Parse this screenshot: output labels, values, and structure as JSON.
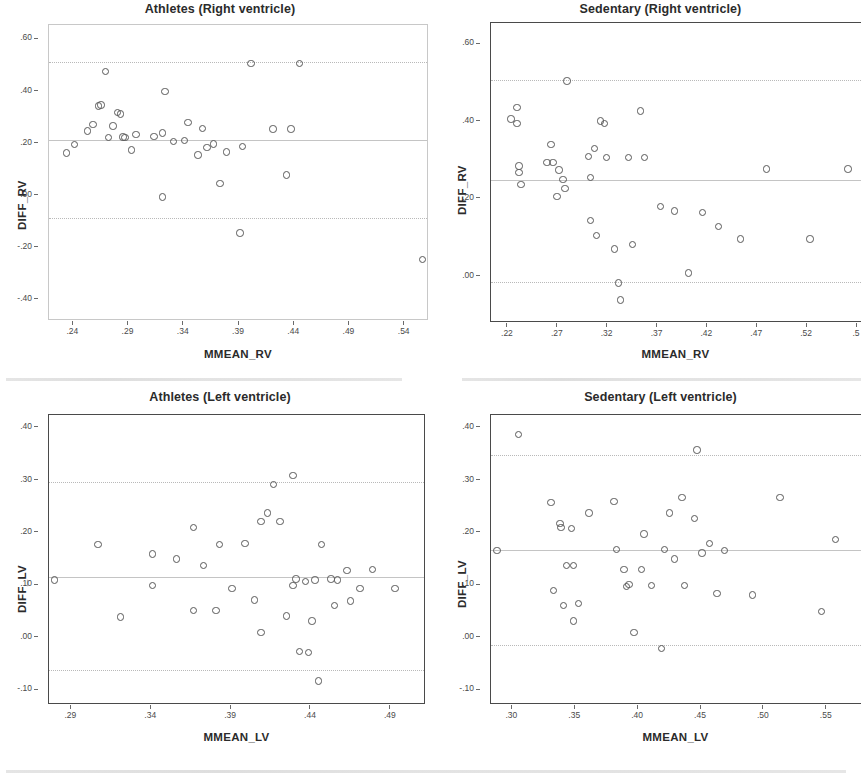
{
  "figure": {
    "background": "#ffffff",
    "marker_color": "#585858",
    "refline_color": "#b9b9b9",
    "frame_color_faint": "#c8c8c8",
    "frame_color_dark": "#4a4a4a"
  },
  "chart_data": [
    {
      "type": "scatter",
      "title": "Athletes (Right ventricle)",
      "xlabel": "MMEAN_RV",
      "ylabel": "DIFF_RV",
      "xlim": [
        0.218,
        0.562
      ],
      "ylim": [
        -0.48,
        0.655
      ],
      "xticks": [
        ".24",
        ".29",
        ".34",
        ".39",
        ".44",
        ".49",
        ".54"
      ],
      "xtick_values": [
        0.24,
        0.29,
        0.34,
        0.39,
        0.44,
        0.49,
        0.54
      ],
      "yticks": [
        ".60",
        ".40",
        ".20",
        ".00",
        "-.20",
        "-.40"
      ],
      "ytick_values": [
        0.6,
        0.4,
        0.2,
        0.0,
        -0.2,
        -0.4
      ],
      "grid": false,
      "legend": "none",
      "reference_lines": [
        {
          "name": "upper-limit-of-agreement",
          "y": 0.515,
          "style": "dotted"
        },
        {
          "name": "mean-difference",
          "y": 0.215,
          "style": "solid"
        },
        {
          "name": "lower-limit-of-agreement",
          "y": -0.085,
          "style": "dotted"
        }
      ],
      "x": [
        0.233,
        0.24,
        0.252,
        0.257,
        0.262,
        0.264,
        0.268,
        0.271,
        0.275,
        0.279,
        0.282,
        0.284,
        0.286,
        0.292,
        0.296,
        0.312,
        0.32,
        0.32,
        0.322,
        0.33,
        0.34,
        0.343,
        0.352,
        0.356,
        0.36,
        0.366,
        0.372,
        0.378,
        0.39,
        0.392,
        0.4,
        0.42,
        0.432,
        0.436,
        0.444,
        0.555
      ],
      "y": [
        0.168,
        0.2,
        0.252,
        0.278,
        0.348,
        0.352,
        0.48,
        0.228,
        0.272,
        0.324,
        0.318,
        0.23,
        0.228,
        0.18,
        0.24,
        0.232,
        0.0,
        0.244,
        0.404,
        0.212,
        0.216,
        0.284,
        0.16,
        0.262,
        0.19,
        0.202,
        0.05,
        0.172,
        -0.138,
        0.192,
        0.512,
        0.26,
        0.084,
        0.26,
        0.512,
        -0.24
      ]
    },
    {
      "type": "scatter",
      "title": "Sedentary (Right ventricle)",
      "xlabel": "MMEAN_RV",
      "ylabel": "DIFF_RV",
      "xlim": [
        0.203,
        0.575
      ],
      "ylim": [
        -0.12,
        0.655
      ],
      "xticks": [
        ".22",
        ".27",
        ".32",
        ".37",
        ".42",
        ".47",
        ".52",
        ".5"
      ],
      "xtick_values": [
        0.22,
        0.27,
        0.32,
        0.37,
        0.42,
        0.47,
        0.52,
        0.57
      ],
      "yticks": [
        ".60",
        ".40",
        ".20",
        ".00"
      ],
      "ytick_values": [
        0.6,
        0.4,
        0.2,
        0.0
      ],
      "grid": false,
      "legend": "none",
      "reference_lines": [
        {
          "name": "upper-limit-of-agreement",
          "y": 0.508,
          "style": "dotted"
        },
        {
          "name": "mean-difference",
          "y": 0.25,
          "style": "solid"
        },
        {
          "name": "lower-limit-of-agreement",
          "y": -0.014,
          "style": "dotted"
        }
      ],
      "x": [
        0.222,
        0.228,
        0.228,
        0.23,
        0.23,
        0.232,
        0.258,
        0.262,
        0.264,
        0.268,
        0.27,
        0.274,
        0.276,
        0.278,
        0.3,
        0.302,
        0.302,
        0.306,
        0.308,
        0.312,
        0.316,
        0.318,
        0.326,
        0.33,
        0.332,
        0.34,
        0.344,
        0.352,
        0.356,
        0.372,
        0.386,
        0.4,
        0.414,
        0.43,
        0.452,
        0.478,
        0.522,
        0.56
      ],
      "y": [
        0.41,
        0.44,
        0.398,
        0.288,
        0.272,
        0.24,
        0.298,
        0.344,
        0.298,
        0.21,
        0.278,
        0.254,
        0.23,
        0.508,
        0.312,
        0.258,
        0.148,
        0.334,
        0.108,
        0.404,
        0.398,
        0.31,
        0.074,
        -0.014,
        -0.058,
        0.31,
        0.086,
        0.43,
        0.31,
        0.184,
        0.172,
        0.012,
        0.168,
        0.132,
        0.1,
        0.28,
        0.1,
        0.28
      ]
    },
    {
      "type": "scatter",
      "title": "Athletes (Left ventricle)",
      "xlabel": "MMEAN_LV",
      "ylabel": "DIFF_LV",
      "xlim": [
        0.276,
        0.512
      ],
      "ylim": [
        -0.128,
        0.425
      ],
      "xticks": [
        ".29",
        ".34",
        ".39",
        ".44",
        ".49"
      ],
      "xtick_values": [
        0.29,
        0.34,
        0.39,
        0.44,
        0.49
      ],
      "yticks": [
        ".40",
        ".30",
        ".20",
        ".10",
        ".00",
        "-.10"
      ],
      "ytick_values": [
        0.4,
        0.3,
        0.2,
        0.1,
        0.0,
        -0.1
      ],
      "grid": false,
      "legend": "none",
      "reference_lines": [
        {
          "name": "upper-limit-of-agreement",
          "y": 0.298,
          "style": "dotted"
        },
        {
          "name": "mean-difference",
          "y": 0.116,
          "style": "solid"
        },
        {
          "name": "lower-limit-of-agreement",
          "y": -0.062,
          "style": "dotted"
        }
      ],
      "x": [
        0.279,
        0.306,
        0.32,
        0.34,
        0.34,
        0.355,
        0.366,
        0.366,
        0.372,
        0.38,
        0.382,
        0.39,
        0.398,
        0.404,
        0.408,
        0.408,
        0.412,
        0.416,
        0.42,
        0.424,
        0.428,
        0.428,
        0.43,
        0.432,
        0.436,
        0.438,
        0.44,
        0.442,
        0.444,
        0.446,
        0.452,
        0.454,
        0.456,
        0.462,
        0.464,
        0.47,
        0.478,
        0.492
      ],
      "y": [
        0.112,
        0.18,
        0.042,
        0.162,
        0.102,
        0.152,
        0.212,
        0.054,
        0.14,
        0.054,
        0.18,
        0.096,
        0.182,
        0.074,
        0.224,
        0.012,
        0.24,
        0.294,
        0.224,
        0.044,
        0.312,
        0.102,
        0.114,
        -0.024,
        0.11,
        -0.026,
        0.034,
        0.112,
        -0.08,
        0.18,
        0.114,
        0.064,
        0.112,
        0.13,
        0.072,
        0.096,
        0.132,
        0.096
      ]
    },
    {
      "type": "scatter",
      "title": "Sedentary (Left ventricle)",
      "xlabel": "MMEAN_LV",
      "ylabel": "DIFF_LV",
      "xlim": [
        0.283,
        0.578
      ],
      "ylim": [
        -0.128,
        0.425
      ],
      "xticks": [
        ".30",
        ".35",
        ".40",
        ".45",
        ".50",
        ".55"
      ],
      "xtick_values": [
        0.3,
        0.35,
        0.4,
        0.45,
        0.5,
        0.55
      ],
      "yticks": [
        ".40",
        ".30",
        ".20",
        ".10",
        ".00",
        "-.10"
      ],
      "ytick_values": [
        0.4,
        0.3,
        0.2,
        0.1,
        0.0,
        -0.1
      ],
      "grid": false,
      "legend": "none",
      "reference_lines": [
        {
          "name": "upper-limit-of-agreement",
          "y": 0.348,
          "style": "dotted"
        },
        {
          "name": "mean-difference",
          "y": 0.168,
          "style": "solid"
        },
        {
          "name": "lower-limit-of-agreement",
          "y": -0.014,
          "style": "dotted"
        }
      ],
      "x": [
        0.287,
        0.304,
        0.33,
        0.332,
        0.337,
        0.338,
        0.34,
        0.342,
        0.346,
        0.348,
        0.348,
        0.352,
        0.36,
        0.38,
        0.382,
        0.388,
        0.39,
        0.392,
        0.396,
        0.402,
        0.404,
        0.41,
        0.418,
        0.42,
        0.424,
        0.428,
        0.434,
        0.436,
        0.444,
        0.446,
        0.45,
        0.456,
        0.462,
        0.468,
        0.49,
        0.512,
        0.545,
        0.556
      ],
      "y": [
        0.168,
        0.39,
        0.26,
        0.092,
        0.22,
        0.212,
        0.064,
        0.14,
        0.21,
        0.034,
        0.14,
        0.068,
        0.24,
        0.262,
        0.17,
        0.132,
        0.1,
        0.104,
        0.012,
        0.132,
        0.2,
        0.102,
        -0.018,
        0.17,
        0.24,
        0.152,
        0.27,
        0.102,
        0.23,
        0.36,
        0.164,
        0.182,
        0.086,
        0.168,
        0.084,
        0.27,
        0.052,
        0.19
      ]
    }
  ]
}
